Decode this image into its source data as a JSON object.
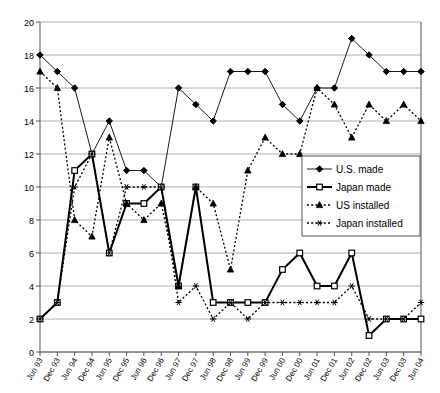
{
  "chart_data": {
    "type": "line",
    "title": "",
    "xlabel": "",
    "ylabel": "",
    "ylim": [
      0,
      20
    ],
    "ytick_step": 2,
    "grid": true,
    "legend_position": "center-right",
    "yticks": [
      "0",
      "2",
      "4",
      "6",
      "8",
      "10",
      "12",
      "14",
      "16",
      "18",
      "20"
    ],
    "categories": [
      "Jun 93",
      "Dec 93",
      "Jun 94",
      "Dec 94",
      "Jun 95",
      "Dec 95",
      "Jun 96",
      "Dec 96",
      "Jun 97",
      "Dec 97",
      "Jun 98",
      "Dec 98",
      "Jun 99",
      "Dec 99",
      "Jun 00",
      "Dec 00",
      "Jun 01",
      "Dec 01",
      "Jun 02",
      "Dec 02",
      "Jun 03",
      "Dec 03",
      "Jun 04"
    ],
    "series": [
      {
        "name": "U.S. made",
        "marker": "diamond",
        "line": "solid-thin",
        "color": "#000000",
        "values": [
          18,
          17,
          16,
          12,
          14,
          11,
          11,
          10,
          16,
          15,
          14,
          17,
          17,
          17,
          15,
          14,
          16,
          16,
          19,
          18,
          17,
          17,
          17
        ]
      },
      {
        "name": "Japan made",
        "marker": "open-square",
        "line": "solid-thick",
        "color": "#000000",
        "values": [
          2,
          3,
          11,
          12,
          6,
          9,
          9,
          10,
          4,
          10,
          3,
          3,
          3,
          3,
          5,
          6,
          4,
          4,
          6,
          1,
          2,
          2,
          2
        ]
      },
      {
        "name": "US installed",
        "marker": "triangle",
        "line": "dotted",
        "color": "#000000",
        "values": [
          17,
          16,
          8,
          7,
          13,
          9,
          8,
          9,
          4,
          10,
          9,
          5,
          11,
          13,
          12,
          12,
          16,
          15,
          13,
          15,
          14,
          15,
          14
        ]
      },
      {
        "name": "Japan installed",
        "marker": "asterisk",
        "line": "dotted",
        "color": "#000000",
        "values": [
          2,
          3,
          10,
          12,
          6,
          10,
          10,
          10,
          3,
          4,
          2,
          3,
          2,
          3,
          3,
          3,
          3,
          3,
          4,
          2,
          2,
          2,
          3
        ]
      }
    ]
  },
  "legend": {
    "entries": [
      {
        "label": "U.S. made"
      },
      {
        "label": "Japan made"
      },
      {
        "label": "US installed"
      },
      {
        "label": "Japan installed"
      }
    ]
  }
}
